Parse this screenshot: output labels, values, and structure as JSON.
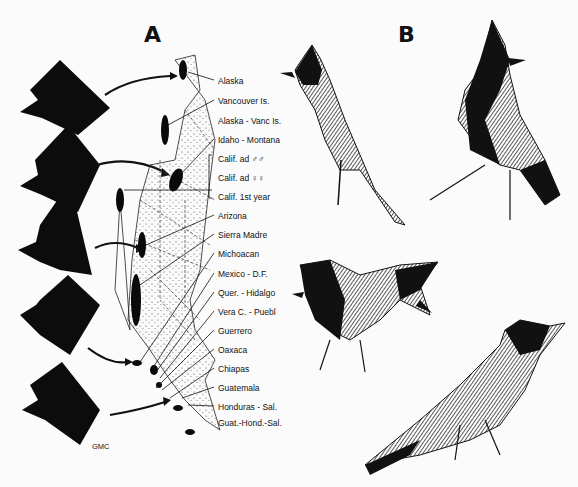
{
  "figure": {
    "panel_a": {
      "letter": "A"
    },
    "panel_b": {
      "letter": "B"
    },
    "credit": "GMC",
    "map_labels": [
      "Alaska",
      "Vancouver Is.",
      "Alaska - Vanc Is.",
      "Idaho - Montana",
      "Calif.  ad ♂♂",
      "Calif.  ad ♀♀",
      "Calif.  1st year",
      "Arizona",
      "Sierra Madre",
      "Michoacan",
      "Mexico - D.F.",
      "Quer. - Hidalgo",
      "Vera C. - Puebl",
      "Guerrero",
      "Oaxaca",
      "Chiapas",
      "Guatemala",
      "Honduras - Sal.",
      "Guat.-Hond.-Sal."
    ],
    "head_silhouettes": [
      "head-1",
      "head-2",
      "head-3",
      "head-4",
      "head-5"
    ],
    "bird_illustrations": [
      "bird-top-left",
      "bird-top-right",
      "bird-bottom-left",
      "bird-bottom-right"
    ]
  }
}
